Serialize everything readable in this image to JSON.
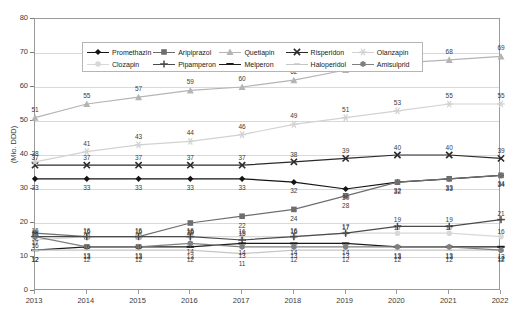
{
  "chart_data": {
    "type": "line",
    "title": "",
    "xlabel": "",
    "ylabel": "(Mio. DDD)",
    "categories": [
      "2013",
      "2014",
      "2015",
      "2016",
      "2017",
      "2018",
      "2019",
      "2020",
      "2021",
      "2022"
    ],
    "ylim": [
      0,
      80
    ],
    "yticks": [
      0,
      10,
      20,
      30,
      40,
      50,
      60,
      70,
      80
    ],
    "grid": true,
    "legend_position": "top-inside",
    "series": [
      {
        "name": "Promethazin",
        "marker": "diamond",
        "color": "#141414",
        "values": [
          33,
          33,
          33,
          33,
          33,
          32,
          30,
          32,
          33,
          34
        ]
      },
      {
        "name": "Aripiprazol",
        "marker": "square",
        "color": "#6e6e6e",
        "values": [
          17,
          16,
          16,
          20,
          22,
          24,
          28,
          32,
          33,
          34
        ]
      },
      {
        "name": "Quetiapin",
        "marker": "triangle",
        "color": "#b4b4b4",
        "values": [
          51,
          55,
          57,
          59,
          60,
          62,
          65,
          67,
          68,
          69
        ]
      },
      {
        "name": "Risperidon",
        "marker": "cross-x",
        "color": "#2b2b2b",
        "values": [
          37,
          37,
          37,
          37,
          37,
          38,
          39,
          40,
          40,
          39
        ]
      },
      {
        "name": "Olanzapin",
        "marker": "star",
        "color": "#d2d2d2",
        "values": [
          38,
          41,
          43,
          44,
          46,
          49,
          51,
          53,
          55,
          55
        ]
      },
      {
        "name": "Clozapin",
        "marker": "circle",
        "color": "#d8d8d8",
        "values": [
          15,
          16,
          16,
          16,
          16,
          16,
          17,
          17,
          17,
          16
        ]
      },
      {
        "name": "Pipamperon",
        "marker": "plus",
        "color": "#4a4a4a",
        "values": [
          16,
          16,
          16,
          16,
          15,
          16,
          17,
          19,
          19,
          21
        ]
      },
      {
        "name": "Melperon",
        "marker": "dash",
        "color": "#1c1c1c",
        "values": [
          12,
          13,
          13,
          13,
          14,
          14,
          14,
          13,
          13,
          13
        ]
      },
      {
        "name": "Haloperidol",
        "marker": "line",
        "color": "#c6c6c6",
        "values": [
          12,
          12,
          12,
          12,
          11,
          12,
          12,
          12,
          12,
          12
        ]
      },
      {
        "name": "Amisulprid",
        "marker": "hex",
        "color": "#808080",
        "values": [
          16,
          13,
          13,
          14,
          13,
          13,
          13,
          13,
          13,
          12
        ]
      }
    ]
  },
  "legend": {
    "row1": [
      {
        "label": "Promethazin",
        "key": "Promethazin"
      },
      {
        "label": "Aripiprazol",
        "key": "Aripiprazol"
      },
      {
        "label": "Quetiapin",
        "key": "Quetiapin"
      },
      {
        "label": "Risperidon",
        "key": "Risperidon"
      },
      {
        "label": "Olanzapin",
        "key": "Olanzapin"
      }
    ],
    "row2": [
      {
        "label": "Clozapin",
        "key": "Clozapin"
      },
      {
        "label": "Pipamperon",
        "key": "Pipamperon"
      },
      {
        "label": "Melperon",
        "key": "Melperon"
      },
      {
        "label": "Haloperidol",
        "key": "Haloperidol"
      },
      {
        "label": "Amisulprid",
        "key": "Amisulprid"
      }
    ]
  },
  "axis": {
    "y_title": "(Mio. DDD)",
    "y_labels": [
      "80",
      "70",
      "60",
      "50",
      "40",
      "30",
      "20",
      "10",
      "0"
    ],
    "x_labels": [
      "2013",
      "2014",
      "2015",
      "2016",
      "2017",
      "2018",
      "2019",
      "2020",
      "2021",
      "2022"
    ]
  },
  "colors": {
    "grid": "#d9d9d9",
    "frame": "#9a9a9a",
    "text": "#3b3b3b",
    "background": "#ffffff"
  }
}
